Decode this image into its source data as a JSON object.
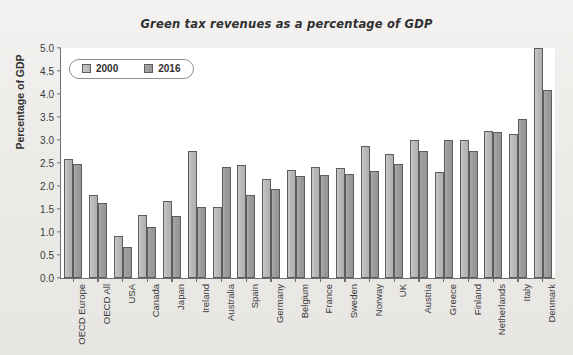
{
  "chart_data": {
    "type": "bar",
    "title": "Green tax revenues as a percentage of GDP",
    "xlabel": "",
    "ylabel": "Percentage of GDP",
    "ylim": [
      0.0,
      5.0
    ],
    "ytick_step": 0.5,
    "yticks": [
      "5.0",
      "4.5",
      "4.0",
      "3.5",
      "3.0",
      "2.5",
      "2.0",
      "1.5",
      "1.0",
      "0.5",
      "0.0"
    ],
    "grid": false,
    "legend_position": "top-left-inside",
    "categories": [
      "OECD Europe",
      "OECD All",
      "USA",
      "Canada",
      "Japan",
      "Ireland",
      "Australia",
      "Spain",
      "Germany",
      "Belgium",
      "France",
      "Sweden",
      "Norway",
      "UK",
      "Austria",
      "Greece",
      "Finland",
      "Netherlands",
      "Italy",
      "Denmark"
    ],
    "series": [
      {
        "name": "2000",
        "color": "#b8b8b8",
        "values": [
          2.58,
          1.8,
          0.91,
          1.38,
          1.68,
          2.77,
          1.55,
          2.45,
          2.16,
          2.35,
          2.42,
          2.4,
          2.88,
          2.7,
          2.99,
          2.3,
          3.01,
          3.2,
          3.14,
          5.0
        ]
      },
      {
        "name": "2016",
        "color": "#9b9b9b",
        "values": [
          2.47,
          1.63,
          0.67,
          1.1,
          1.35,
          1.55,
          2.42,
          1.8,
          1.93,
          2.21,
          2.23,
          2.27,
          2.32,
          2.47,
          2.77,
          3.0,
          2.76,
          3.17,
          3.45,
          4.08
        ]
      }
    ]
  },
  "legend": {
    "entries": [
      {
        "label": "2000"
      },
      {
        "label": "2016"
      }
    ]
  }
}
